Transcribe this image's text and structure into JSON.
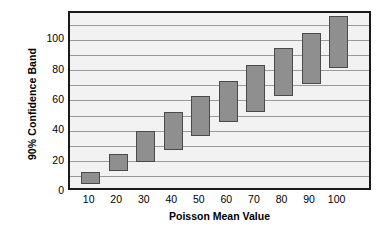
{
  "chart_data": {
    "type": "bar",
    "title": "",
    "subtitle": "",
    "xlabel": "Poisson Mean Value",
    "ylabel": "90% Confidence Band",
    "categories": [
      "10",
      "20",
      "30",
      "40",
      "50",
      "60",
      "70",
      "80",
      "90",
      "100"
    ],
    "x": [
      10,
      20,
      30,
      40,
      50,
      60,
      70,
      80,
      90,
      100
    ],
    "xtick_labels": [
      "10",
      "20",
      "30",
      "40",
      "50",
      "60",
      "70",
      "80",
      "90",
      "100"
    ],
    "ytick_labels": [
      "0",
      "20",
      "40",
      "60",
      "80",
      "100"
    ],
    "yticks": [
      0,
      20,
      40,
      60,
      80,
      100
    ],
    "ylim": [
      0,
      118
    ],
    "xlim": [
      0,
      11
    ],
    "grid": true,
    "grid_orientation": "horizontal",
    "grid_interval": 10,
    "legend": false,
    "legend_position": "none",
    "bar_style": "floating-range-bar",
    "series": [
      {
        "name": "90% Confidence Band",
        "lower": [
          5,
          14,
          20,
          28,
          37,
          46,
          53,
          63,
          71,
          82
        ],
        "upper": [
          13,
          25,
          40,
          53,
          63,
          73,
          84,
          95,
          105,
          116
        ]
      }
    ],
    "bars": [
      {
        "category": "10",
        "lower": 5,
        "upper": 13
      },
      {
        "category": "20",
        "lower": 14,
        "upper": 25
      },
      {
        "category": "30",
        "lower": 20,
        "upper": 40
      },
      {
        "category": "40",
        "lower": 28,
        "upper": 53
      },
      {
        "category": "50",
        "lower": 37,
        "upper": 63
      },
      {
        "category": "60",
        "lower": 46,
        "upper": 73
      },
      {
        "category": "70",
        "lower": 53,
        "upper": 84
      },
      {
        "category": "80",
        "lower": 63,
        "upper": 95
      },
      {
        "category": "90",
        "lower": 71,
        "upper": 105
      },
      {
        "category": "100",
        "lower": 82,
        "upper": 116
      }
    ],
    "colors": {
      "bar_fill": "#8f8f8f",
      "bar_border": "#4a4a4a",
      "plot_background": "#f2f2f2",
      "gridline": "#9a9a9a",
      "frame": "#1a1a1a",
      "text": "#000000",
      "page_background": "#ffffff"
    }
  }
}
